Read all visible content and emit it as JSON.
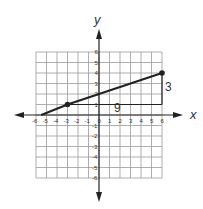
{
  "chart_data": {
    "type": "line",
    "title": "",
    "xlabel": "x",
    "ylabel": "y",
    "xlim": [
      -6,
      6
    ],
    "ylim": [
      -6,
      6
    ],
    "grid": true,
    "x_ticks": [
      "-6",
      "-5",
      "-4",
      "-3",
      "-2",
      "-1",
      "0",
      "1",
      "2",
      "3",
      "4",
      "5",
      "6"
    ],
    "y_ticks_positive": [
      "1",
      "2",
      "3",
      "4",
      "5",
      "6"
    ],
    "y_ticks_negative": [
      "-1",
      "-2",
      "-3",
      "-4",
      "-5",
      "-6"
    ],
    "series": [
      {
        "name": "line",
        "x": [
          -5.5,
          -3,
          6
        ],
        "y": [
          0,
          1,
          4
        ],
        "marked_points": [
          [
            -3,
            1
          ],
          [
            6,
            4
          ]
        ]
      }
    ],
    "annotations": [
      {
        "type": "run",
        "from": [
          -3,
          1
        ],
        "to": [
          6,
          1
        ],
        "label": "9"
      },
      {
        "type": "rise",
        "from": [
          6,
          1
        ],
        "to": [
          6,
          4
        ],
        "label": "3"
      }
    ]
  },
  "labels": {
    "x_axis": "x",
    "y_axis": "y",
    "run": "9",
    "rise": "3"
  }
}
